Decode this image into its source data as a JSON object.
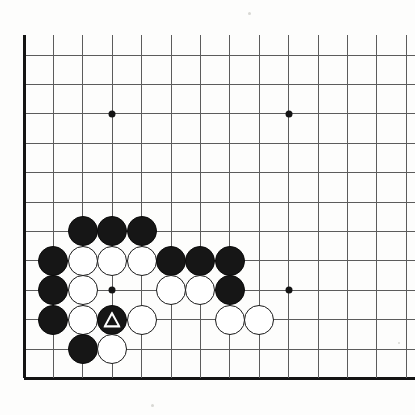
{
  "board": {
    "title": "Go board position",
    "type": "go-goban",
    "visible_region": "lower-left corner of a 19x19 board",
    "grid": {
      "origin_x": 24,
      "origin_y": 55,
      "spacing": 29.4,
      "columns_visible": 14,
      "rows_visible": 12,
      "line_color": "#5c5c5c",
      "edge_color": "#141414",
      "background_color": "#fdfdfc"
    },
    "edges": {
      "left_edge_index": 0,
      "bottom_edge_index": 11,
      "left_edge_label": "board-left-edge",
      "bottom_edge_label": "board-bottom-edge"
    },
    "star_points": [
      {
        "col": 3,
        "row": 2,
        "name": "star-point-upper-left"
      },
      {
        "col": 9,
        "row": 2,
        "name": "star-point-upper-right"
      },
      {
        "col": 3,
        "row": 8,
        "name": "star-point-lower-left"
      },
      {
        "col": 9,
        "row": 8,
        "name": "star-point-lower-right"
      }
    ],
    "stones": [
      {
        "col": 2,
        "row": 6,
        "color": "black",
        "marker": "none"
      },
      {
        "col": 3,
        "row": 6,
        "color": "black",
        "marker": "none"
      },
      {
        "col": 4,
        "row": 6,
        "color": "black",
        "marker": "none"
      },
      {
        "col": 1,
        "row": 7,
        "color": "black",
        "marker": "none"
      },
      {
        "col": 2,
        "row": 7,
        "color": "white",
        "marker": "none"
      },
      {
        "col": 3,
        "row": 7,
        "color": "white",
        "marker": "none"
      },
      {
        "col": 4,
        "row": 7,
        "color": "white",
        "marker": "none"
      },
      {
        "col": 5,
        "row": 7,
        "color": "black",
        "marker": "none"
      },
      {
        "col": 6,
        "row": 7,
        "color": "black",
        "marker": "none"
      },
      {
        "col": 7,
        "row": 7,
        "color": "black",
        "marker": "none"
      },
      {
        "col": 1,
        "row": 8,
        "color": "black",
        "marker": "none"
      },
      {
        "col": 2,
        "row": 8,
        "color": "white",
        "marker": "none"
      },
      {
        "col": 5,
        "row": 8,
        "color": "white",
        "marker": "none"
      },
      {
        "col": 6,
        "row": 8,
        "color": "white",
        "marker": "none"
      },
      {
        "col": 7,
        "row": 8,
        "color": "black",
        "marker": "none"
      },
      {
        "col": 1,
        "row": 9,
        "color": "black",
        "marker": "none"
      },
      {
        "col": 2,
        "row": 9,
        "color": "white",
        "marker": "none"
      },
      {
        "col": 3,
        "row": 9,
        "color": "black",
        "marker": "triangle"
      },
      {
        "col": 4,
        "row": 9,
        "color": "white",
        "marker": "none"
      },
      {
        "col": 7,
        "row": 9,
        "color": "white",
        "marker": "none"
      },
      {
        "col": 8,
        "row": 9,
        "color": "white",
        "marker": "none"
      },
      {
        "col": 2,
        "row": 10,
        "color": "black",
        "marker": "none"
      },
      {
        "col": 3,
        "row": 10,
        "color": "white",
        "marker": "none"
      }
    ],
    "marker_legend": {
      "triangle": "triangle-marked-black-stone",
      "triangle_stroke_color": "#ffffff"
    },
    "counts": {
      "black_stones": 13,
      "white_stones": 11,
      "marked_stones": 1
    }
  },
  "page": {
    "scan_specks": [
      {
        "x": 248,
        "y": 12,
        "size": 3
      },
      {
        "x": 151,
        "y": 404,
        "size": 3
      },
      {
        "x": 398,
        "y": 342,
        "size": 2
      }
    ]
  }
}
